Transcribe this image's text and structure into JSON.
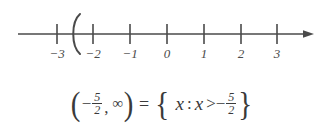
{
  "figure": {
    "background_color": "#ffffff",
    "ink_color": "#3a3a3a"
  },
  "number_line": {
    "name": "number-line",
    "axis": {
      "min_visible": -3.6,
      "max_visible": 3.9,
      "has_right_arrow": true,
      "has_left_arrow": false,
      "y_pixel": 34
    },
    "ticks": [
      {
        "value": -3,
        "label": "−3",
        "x": 57
      },
      {
        "value": -2,
        "label": "−2",
        "x": 93
      },
      {
        "value": -1,
        "label": "−1",
        "x": 130
      },
      {
        "value": 0,
        "label": "0",
        "x": 167
      },
      {
        "value": 1,
        "label": "1",
        "x": 204
      },
      {
        "value": 2,
        "label": "2",
        "x": 241
      },
      {
        "value": 3,
        "label": "3",
        "x": 277
      }
    ],
    "endpoint_marker": {
      "symbol": "(",
      "type": "open-parenthesis",
      "value": -2.5,
      "x": 75,
      "included": false
    },
    "shaded_direction": "right-to-infinity"
  },
  "equation": {
    "name": "interval-set-equation",
    "plain_text": "(−5/2, ∞) = { x : x > −5/2 }",
    "interval": {
      "open_paren": "(",
      "minus": "−",
      "fraction_numerator": "5",
      "fraction_denominator": "2",
      "comma": ",",
      "infinity": "∞",
      "close_paren": ")"
    },
    "equals": "=",
    "set_builder": {
      "open_brace": "{",
      "variable": "x",
      "colon": ":",
      "variable2": "x",
      "relation": ">",
      "minus": "−",
      "fraction_numerator": "5",
      "fraction_denominator": "2",
      "close_brace": "}"
    }
  }
}
